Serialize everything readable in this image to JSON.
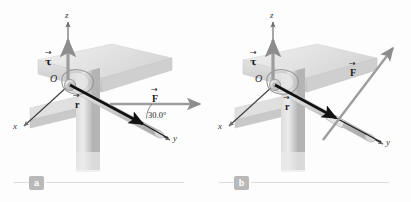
{
  "figure": {
    "kind": "physics-vector-diagram",
    "background_color": "#fdfdfd",
    "axis_color": "#6e6e6e",
    "vector_color": "#8d8d8d",
    "handle_color": "#141414",
    "metal_light": "#e3e3e3",
    "metal_mid": "#c9c9c9",
    "metal_dark": "#a8a8a8",
    "beam_light": "#e8e8e8",
    "beam_mid": "#d4d4d4",
    "beam_dark": "#bdbdbd"
  },
  "panels": [
    {
      "id": "a",
      "badge": "a",
      "axes": [
        {
          "name": "z-axis",
          "label": "z"
        },
        {
          "name": "x-axis",
          "label": "x"
        },
        {
          "name": "y-axis",
          "label": "y"
        }
      ],
      "origin_label": "O",
      "vectors": [
        {
          "name": "torque-vector",
          "symbol": "τ",
          "direction": "+z"
        },
        {
          "name": "position-vector",
          "symbol": "r",
          "direction": "along wrench handle toward +y"
        },
        {
          "name": "force-vector",
          "symbol": "F",
          "direction": "horizontal, in x-y plane"
        }
      ],
      "angle": {
        "value": "30.0°",
        "between": "force and wrench handle"
      }
    },
    {
      "id": "b",
      "badge": "b",
      "axes": [
        {
          "name": "z-axis",
          "label": "z"
        },
        {
          "name": "x-axis",
          "label": "x"
        },
        {
          "name": "y-axis",
          "label": "y"
        }
      ],
      "origin_label": "O",
      "vectors": [
        {
          "name": "torque-vector",
          "symbol": "τ",
          "direction": "+z"
        },
        {
          "name": "position-vector",
          "symbol": "r",
          "direction": "along wrench handle toward +y"
        },
        {
          "name": "force-vector",
          "symbol": "F",
          "direction": "obliquely upward out of the x-y plane"
        }
      ],
      "angle": null
    }
  ]
}
